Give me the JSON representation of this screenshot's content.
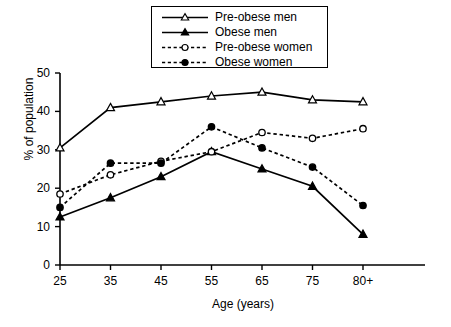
{
  "chart_data": {
    "type": "line",
    "title": "",
    "xlabel": "Age (years)",
    "ylabel": "% of population",
    "categories": [
      "25",
      "35",
      "45",
      "55",
      "65",
      "75",
      "80+"
    ],
    "xlim": [
      0,
      6
    ],
    "ylim": [
      0,
      50
    ],
    "yticks": [
      0,
      10,
      20,
      30,
      40,
      50
    ],
    "grid": false,
    "legend_position": "top-center",
    "series": [
      {
        "name": "Pre-obese men",
        "marker": "open-triangle",
        "line": "solid",
        "color": "#000000",
        "values": [
          30.5,
          41,
          42.5,
          44,
          45,
          43,
          42.5
        ]
      },
      {
        "name": "Obese men",
        "marker": "filled-triangle",
        "line": "solid",
        "color": "#000000",
        "values": [
          12.5,
          17.5,
          23,
          29.5,
          25,
          20.5,
          8
        ]
      },
      {
        "name": "Pre-obese women",
        "marker": "open-circle",
        "line": "dashed",
        "color": "#000000",
        "values": [
          18.5,
          23.5,
          27,
          29.5,
          34.5,
          33,
          35.5
        ]
      },
      {
        "name": "Obese women",
        "marker": "filled-circle",
        "line": "dashed",
        "color": "#000000",
        "values": [
          15,
          26.5,
          26.5,
          36,
          30.5,
          25.5,
          15.5
        ]
      }
    ]
  },
  "axes": {
    "y_tick_labels": [
      "0",
      "10",
      "20",
      "30",
      "40",
      "50"
    ],
    "x_tick_labels": [
      "25",
      "35",
      "45",
      "55",
      "65",
      "75",
      "80+"
    ],
    "y_axis_title": "% of population",
    "x_axis_title": "Age (years)"
  },
  "legend": {
    "entries": [
      {
        "label": "Pre-obese men"
      },
      {
        "label": "Obese men"
      },
      {
        "label": "Pre-obese women"
      },
      {
        "label": "Obese women"
      }
    ]
  }
}
